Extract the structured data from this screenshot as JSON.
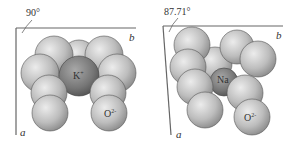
{
  "panels": [
    {
      "id": "left",
      "angle_label": "90°",
      "axis_a": "a",
      "axis_b": "b",
      "cation_label": "K",
      "cation_charge": "+",
      "anion_label": "O",
      "anion_charge": "2-"
    },
    {
      "id": "right",
      "angle_label": "87.71°",
      "axis_a": "a",
      "axis_b": "b",
      "cation_label": "Na",
      "cation_charge": "+",
      "anion_label": "O",
      "anion_charge": "2-"
    }
  ],
  "colors": {
    "anion_light": "#e8e8e8",
    "anion_dark": "#8a8a8a",
    "cation_light": "#9a9a9a",
    "cation_dark": "#4a4a4a",
    "line": "#555555"
  }
}
